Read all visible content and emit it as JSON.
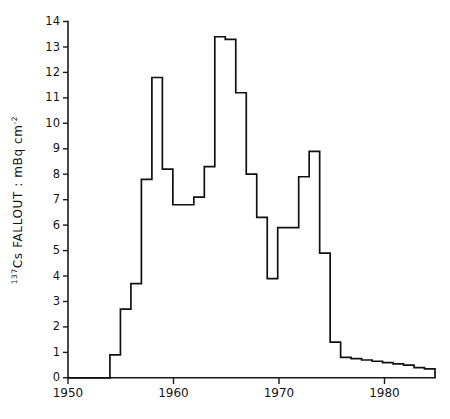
{
  "chart_data": {
    "type": "line",
    "subtype": "step",
    "title": "",
    "xlabel": "",
    "ylabel": "137Cs FALLOUT : mBq cm-2",
    "ylabel_parts": {
      "isotope_superscript": "137",
      "element": "Cs",
      "word": "FALLOUT",
      "separator": ":",
      "unit_base": "mBq cm",
      "unit_superscript": "-2"
    },
    "xlim": [
      1950,
      1985
    ],
    "ylim": [
      0,
      14
    ],
    "grid": false,
    "legend": null,
    "x_ticks": [
      1950,
      1960,
      1970,
      1980
    ],
    "x_tick_labels": [
      "1950",
      "1960",
      "1970",
      "1980"
    ],
    "y_ticks": [
      0,
      1,
      2,
      3,
      4,
      5,
      6,
      7,
      8,
      9,
      10,
      11,
      12,
      13,
      14
    ],
    "y_tick_labels": [
      "0",
      "1",
      "2",
      "3",
      "4",
      "5",
      "6",
      "7",
      "8",
      "9",
      "10",
      "11",
      "12",
      "13",
      "14"
    ],
    "x": [
      1950,
      1951,
      1952,
      1953,
      1954,
      1955,
      1956,
      1957,
      1958,
      1959,
      1960,
      1961,
      1962,
      1963,
      1964,
      1965,
      1966,
      1967,
      1968,
      1969,
      1970,
      1971,
      1972,
      1973,
      1974,
      1975,
      1976,
      1977,
      1978,
      1979,
      1980,
      1981,
      1982,
      1983,
      1984
    ],
    "values": [
      0,
      0,
      0,
      0,
      0.9,
      2.7,
      3.7,
      7.8,
      11.8,
      8.2,
      6.8,
      6.8,
      7.1,
      8.3,
      13.4,
      13.3,
      11.2,
      8.0,
      6.3,
      3.9,
      5.9,
      5.9,
      7.9,
      8.9,
      4.9,
      1.4,
      0.8,
      0.75,
      0.7,
      0.65,
      0.6,
      0.55,
      0.5,
      0.4,
      0.35
    ],
    "series_name": "137Cs annual fallout deposition",
    "units": "mBq cm-2"
  },
  "axes": {
    "y_axis_name": "y-axis",
    "x_axis_name": "x-axis"
  }
}
